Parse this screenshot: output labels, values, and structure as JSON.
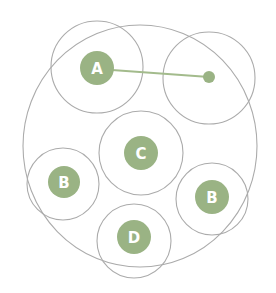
{
  "diagram": {
    "type": "circle-grouping",
    "colors": {
      "node_fill": "#9ab384",
      "outline": "#ababab",
      "link": "#a3bb8c",
      "label": "#ffffff",
      "background": "#ffffff"
    },
    "outer_boundary": {
      "cx": 140,
      "cy": 146,
      "rx": 117,
      "ry": 121
    },
    "nodes": [
      {
        "id": "A",
        "label": "A",
        "cx": 97,
        "cy": 68,
        "r": 17,
        "ring_cx": 97,
        "ring_cy": 67,
        "ring_r": 46
      },
      {
        "id": "target",
        "label": "",
        "cx": 209,
        "cy": 77,
        "r": 6,
        "ring_cx": 209,
        "ring_cy": 78,
        "ring_r": 46
      },
      {
        "id": "C",
        "label": "C",
        "cx": 141,
        "cy": 153,
        "r": 17,
        "ring_cx": 141,
        "ring_cy": 153,
        "ring_r": 42
      },
      {
        "id": "B-left",
        "label": "B",
        "cx": 64,
        "cy": 182,
        "r": 16,
        "ring_cx": 63,
        "ring_cy": 184,
        "ring_r": 36
      },
      {
        "id": "B-right",
        "label": "B",
        "cx": 212,
        "cy": 197,
        "r": 17,
        "ring_cx": 212,
        "ring_cy": 199,
        "ring_r": 36
      },
      {
        "id": "D",
        "label": "D",
        "cx": 134,
        "cy": 237,
        "r": 17,
        "ring_cx": 134,
        "ring_cy": 241,
        "ring_r": 37
      }
    ],
    "links": [
      {
        "from": "A",
        "to": "target",
        "x1": 112,
        "y1": 70,
        "x2": 209,
        "y2": 77
      }
    ]
  }
}
